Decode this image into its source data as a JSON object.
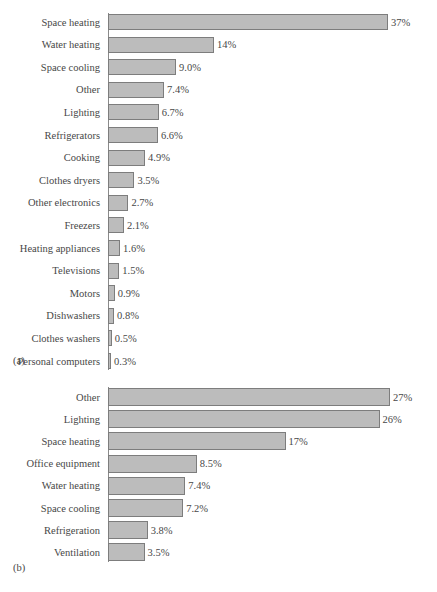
{
  "figure": {
    "panel_a_tag": "(a)",
    "panel_b_tag": "(b)"
  },
  "chart_data": [
    {
      "id": "a",
      "type": "bar",
      "orientation": "horizontal",
      "title": "",
      "xlabel": "",
      "ylabel": "",
      "grid": false,
      "legend": "none",
      "panel_label": "(a)",
      "xlim": [
        0,
        37
      ],
      "categories": [
        "Space heating",
        "Water heating",
        "Space cooling",
        "Other",
        "Lighting",
        "Refrigerators",
        "Cooking",
        "Clothes dryers",
        "Other electronics",
        "Freezers",
        "Heating appliances",
        "Televisions",
        "Motors",
        "Dishwashers",
        "Clothes washers",
        "Personal computers"
      ],
      "values": [
        37,
        14,
        9.0,
        7.4,
        6.7,
        6.6,
        4.9,
        3.5,
        2.7,
        2.1,
        1.6,
        1.5,
        0.9,
        0.8,
        0.5,
        0.3
      ],
      "data_labels": [
        "37%",
        "14%",
        "9.0%",
        "7.4%",
        "6.7%",
        "6.6%",
        "4.9%",
        "3.5%",
        "2.7%",
        "2.1%",
        "1.6%",
        "1.5%",
        "0.9%",
        "0.8%",
        "0.5%",
        "0.3%"
      ]
    },
    {
      "id": "b",
      "type": "bar",
      "orientation": "horizontal",
      "title": "",
      "xlabel": "",
      "ylabel": "",
      "grid": false,
      "legend": "none",
      "panel_label": "(b)",
      "xlim": [
        0,
        27
      ],
      "categories": [
        "Other",
        "Lighting",
        "Space heating",
        "Office equipment",
        "Water heating",
        "Space cooling",
        "Refrigeration",
        "Ventilation"
      ],
      "values": [
        27,
        26,
        17,
        8.5,
        7.4,
        7.2,
        3.8,
        3.5
      ],
      "data_labels": [
        "27%",
        "26%",
        "17%",
        "8.5%",
        "7.4%",
        "7.2%",
        "3.8%",
        "3.5%"
      ]
    }
  ],
  "style": {
    "bar_fill": "#bcbcbc",
    "bar_stroke": "#7d7d7d",
    "axis_color": "#8a8a8a",
    "text_color": "#474747",
    "background": "#ffffff"
  }
}
